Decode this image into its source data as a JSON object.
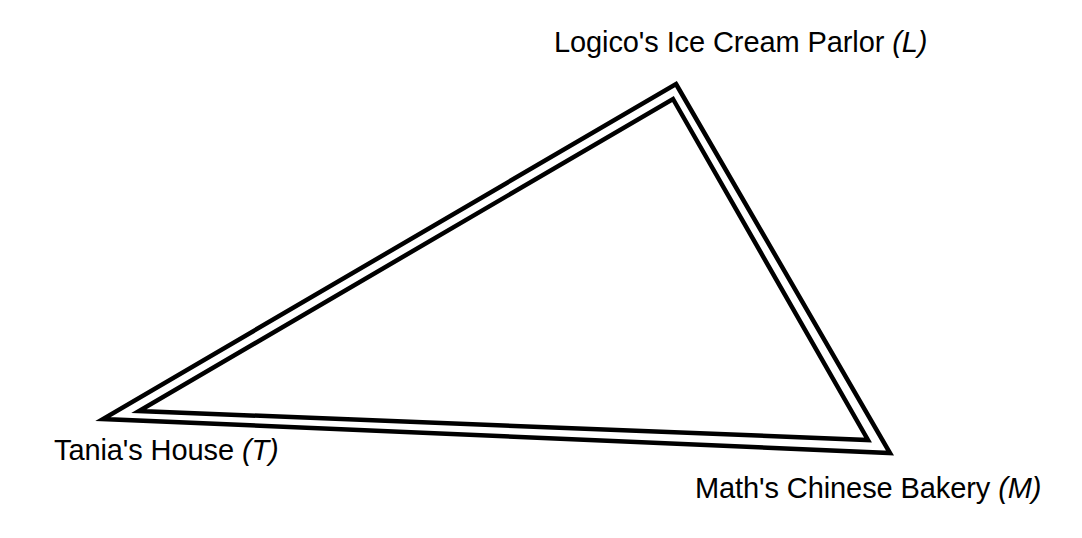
{
  "diagram": {
    "type": "triangle-map",
    "background_color": "#ffffff",
    "stroke_color": "#000000",
    "stroke_width": 4.5,
    "double_line_gap": 5,
    "canvas": {
      "width": 1082,
      "height": 538
    },
    "vertices": [
      {
        "id": "L",
        "key": "logico",
        "place_name": "Logico's Ice Cream Parlor",
        "point_tag": "(L)",
        "outer": {
          "x": 676,
          "y": 84
        },
        "inner": {
          "x": 673,
          "y": 99
        },
        "label_position": "above"
      },
      {
        "id": "T",
        "key": "tania",
        "place_name": "Tania's House",
        "point_tag": "(T)",
        "outer": {
          "x": 103,
          "y": 419
        },
        "inner": {
          "x": 139,
          "y": 411
        },
        "label_position": "below-left"
      },
      {
        "id": "M",
        "key": "math",
        "place_name": "Math's Chinese Bakery",
        "point_tag": "(M)",
        "outer": {
          "x": 890,
          "y": 453
        },
        "inner": {
          "x": 868,
          "y": 440
        },
        "label_position": "below-right"
      }
    ],
    "edges": [
      {
        "id": "TL",
        "from": "T",
        "to": "L"
      },
      {
        "id": "LM",
        "from": "L",
        "to": "M"
      },
      {
        "id": "MT",
        "from": "M",
        "to": "T"
      }
    ]
  },
  "labels": {
    "logico": {
      "place_name": "Logico's Ice Cream Parlor",
      "point_tag": "(L)"
    },
    "tania": {
      "place_name": "Tania's House",
      "point_tag": "(T)"
    },
    "math": {
      "place_name": "Math's Chinese Bakery",
      "point_tag": "(M)"
    }
  }
}
